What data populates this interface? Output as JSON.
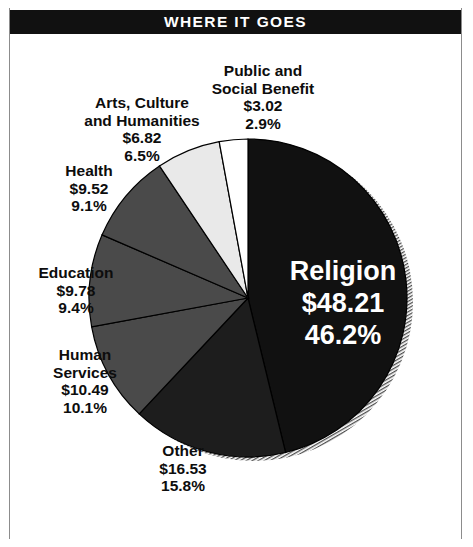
{
  "header": {
    "title": "WHERE IT GOES"
  },
  "colors": {
    "band_background": "#111111",
    "band_text": "#ffffff",
    "page_background": "#ffffff",
    "frame_line": "#8c8c8c",
    "slice_religion": "#111111",
    "slice_other": "#1d1d1d",
    "slice_human_services": "#4a4a4a",
    "slice_education": "#4a4a4a",
    "slice_health": "#4a4a4a",
    "slice_arts": "#e9e9e9",
    "slice_public": "#ffffff",
    "slice_outline": "#000000",
    "shadow": "#b5b5b5"
  },
  "chart_data": {
    "type": "pie",
    "title": "WHERE IT GOES",
    "value_prefix": "$",
    "start_angle_deg": 0,
    "direction": "clockwise",
    "legend": "callout-labels",
    "categories": [
      "Religion",
      "Other",
      "Human Services",
      "Education",
      "Health",
      "Arts, Culture and Humanities",
      "Public and Social Benefit"
    ],
    "values": [
      48.21,
      16.53,
      10.49,
      9.78,
      9.52,
      6.82,
      3.02
    ],
    "percentages": [
      46.2,
      15.8,
      10.1,
      9.4,
      9.1,
      6.5,
      2.9
    ],
    "slices": [
      {
        "name": "Religion",
        "amount": "$48.21",
        "percent": "46.2%",
        "value": 48.21,
        "pct": 46.2,
        "fill": "#111111",
        "label_placement": "inside",
        "label_color": "#ffffff"
      },
      {
        "name": "Other",
        "amount": "$16.53",
        "percent": "15.8%",
        "value": 16.53,
        "pct": 15.8,
        "fill": "#1d1d1d",
        "label_placement": "outside",
        "label_color": "#0d0d0d"
      },
      {
        "name": "Human Services",
        "name_line1": "Human",
        "name_line2": "Services",
        "amount": "$10.49",
        "percent": "10.1%",
        "value": 10.49,
        "pct": 10.1,
        "fill": "#4a4a4a",
        "label_placement": "outside",
        "label_color": "#0d0d0d"
      },
      {
        "name": "Education",
        "amount": "$9.78",
        "percent": "9.4%",
        "value": 9.78,
        "pct": 9.4,
        "fill": "#4a4a4a",
        "label_placement": "outside",
        "label_color": "#0d0d0d"
      },
      {
        "name": "Health",
        "amount": "$9.52",
        "percent": "9.1%",
        "value": 9.52,
        "pct": 9.1,
        "fill": "#4a4a4a",
        "label_placement": "outside",
        "label_color": "#0d0d0d"
      },
      {
        "name": "Arts, Culture and Humanities",
        "name_line1": "Arts, Culture",
        "name_line2": "and Humanities",
        "amount": "$6.82",
        "percent": "6.5%",
        "value": 6.82,
        "pct": 6.5,
        "fill": "#e9e9e9",
        "label_placement": "outside",
        "label_color": "#0d0d0d"
      },
      {
        "name": "Public and Social Benefit",
        "name_line1": "Public and",
        "name_line2": "Social Benefit",
        "amount": "$3.02",
        "percent": "2.9%",
        "value": 3.02,
        "pct": 2.9,
        "fill": "#ffffff",
        "label_placement": "outside",
        "label_color": "#0d0d0d"
      }
    ]
  }
}
